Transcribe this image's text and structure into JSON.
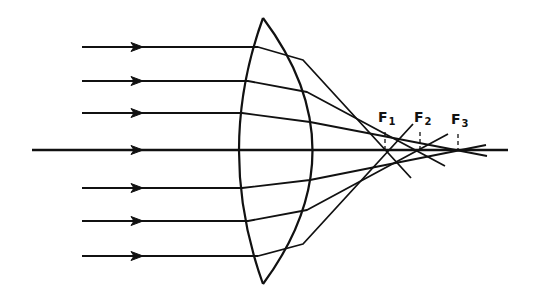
{
  "diagram": {
    "stroke_color": "#111111",
    "background": "#ffffff",
    "axis": {
      "x1": 32,
      "x2": 508,
      "y": 150
    },
    "lens": {
      "top": [
        263,
        18
      ],
      "bottom": [
        263,
        284
      ],
      "left_ctrl": [
        215,
        150
      ],
      "right_ctrl": [
        362,
        150
      ]
    },
    "rays": [
      {
        "id": "outer-top",
        "y": 47,
        "start_x": 82,
        "hit_left": [
          258,
          47
        ],
        "exit": [
          303,
          60
        ],
        "end": [
          411,
          178
        ]
      },
      {
        "id": "middle-top",
        "y": 81,
        "start_x": 82,
        "hit_left": [
          248,
          81
        ],
        "exit": [
          307,
          92
        ],
        "end": [
          445,
          166
        ]
      },
      {
        "id": "inner-top",
        "y": 113,
        "start_x": 82,
        "hit_left": [
          242,
          113
        ],
        "exit": [
          310,
          122
        ],
        "end": [
          487,
          156
        ]
      },
      {
        "id": "axial",
        "y": 150,
        "start_x": 32
      },
      {
        "id": "inner-bottom",
        "y": 188,
        "start_x": 82,
        "hit_left": [
          242,
          188
        ],
        "exit": [
          310,
          180
        ],
        "end": [
          486,
          145
        ]
      },
      {
        "id": "middle-bottom",
        "y": 221,
        "start_x": 82,
        "hit_left": [
          248,
          221
        ],
        "exit": [
          307,
          210
        ],
        "end": [
          448,
          134
        ]
      },
      {
        "id": "outer-bottom",
        "y": 256,
        "start_x": 82,
        "hit_left": [
          258,
          256
        ],
        "exit": [
          303,
          244
        ],
        "end": [
          413,
          124
        ]
      }
    ],
    "arrow_x": 140,
    "foci": [
      {
        "label": "F",
        "sub": "1",
        "x": 385,
        "label_x": 378,
        "label_y": 120
      },
      {
        "label": "F",
        "sub": "2",
        "x": 420,
        "label_x": 414,
        "label_y": 120
      },
      {
        "label": "F",
        "sub": "3",
        "x": 458,
        "label_x": 451,
        "label_y": 122
      }
    ]
  }
}
